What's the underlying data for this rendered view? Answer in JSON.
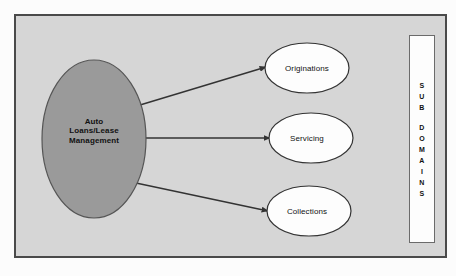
{
  "diagram": {
    "frame": {
      "background_color": "#d6d6d6",
      "border_color": "#4a4a4a"
    },
    "main_node": {
      "label": "Auto\nLoans/Lease\nManagement",
      "shape": "ellipse",
      "fill_color": "#9a9a9a",
      "stroke_color": "#555555"
    },
    "sub_nodes": [
      {
        "label": "Originations",
        "shape": "ellipse",
        "fill_color": "#fdfdfd",
        "stroke_color": "#333333"
      },
      {
        "label": "Servicing",
        "shape": "ellipse",
        "fill_color": "#fdfdfd",
        "stroke_color": "#333333"
      },
      {
        "label": "Collections",
        "shape": "ellipse",
        "fill_color": "#fdfdfd",
        "stroke_color": "#333333"
      }
    ],
    "connectors": [
      {
        "from": "Auto Loans/Lease Management",
        "to": "Originations",
        "style": "arrow"
      },
      {
        "from": "Auto Loans/Lease Management",
        "to": "Servicing",
        "style": "arrow"
      },
      {
        "from": "Auto Loans/Lease Management",
        "to": "Collections",
        "style": "arrow"
      }
    ],
    "legend": {
      "text": "SUB DOMAINS",
      "orientation": "vertical-stacked",
      "line1": [
        "S",
        "U",
        "B"
      ],
      "line2": [
        "D",
        "O",
        "M",
        "A",
        "I",
        "N",
        "S"
      ],
      "background_color": "#fdfdfd",
      "border_color": "#6b6b6b"
    }
  }
}
